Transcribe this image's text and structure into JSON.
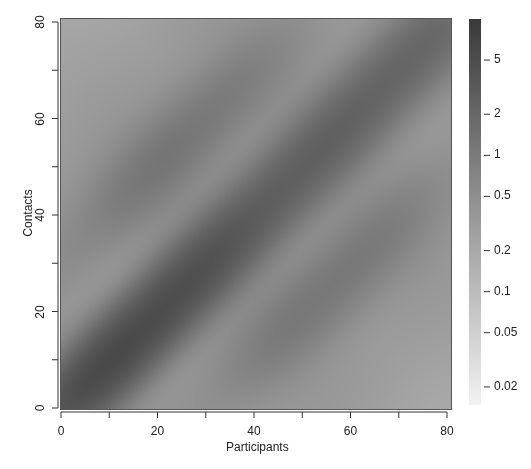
{
  "chart_data": {
    "type": "heatmap",
    "title": "",
    "xlabel": "Participants",
    "ylabel": "Contacts",
    "xlim": [
      0,
      80
    ],
    "ylim": [
      0,
      80
    ],
    "x_ticks": [
      0,
      20,
      40,
      60,
      80
    ],
    "x_minor_ticks": [
      10,
      30,
      50,
      70
    ],
    "y_ticks": [
      0,
      20,
      40,
      60,
      80
    ],
    "y_minor_ticks": [
      10,
      30,
      50,
      70
    ],
    "colorbar": {
      "scale": "log",
      "ticks": [
        5,
        2,
        1,
        0.5,
        0.2,
        0.1,
        0.05,
        0.02
      ],
      "tick_labels": [
        "5",
        "2",
        "1",
        "0.5",
        "0.2",
        "0.1",
        "0.05",
        "0.02"
      ],
      "range": [
        0.015,
        10
      ],
      "color_low": "#f2f2f2",
      "color_high": "#3a3a3a"
    },
    "features": [
      {
        "type": "diagonal",
        "offset": 0,
        "peak_age": 12,
        "intensity": 5.0,
        "width": 6
      },
      {
        "type": "diagonal",
        "offset": 0,
        "peak_age": 40,
        "intensity": 1.8,
        "width": 7
      },
      {
        "type": "diagonal",
        "offset": 0,
        "peak_age": 70,
        "intensity": 1.6,
        "width": 7
      },
      {
        "type": "offdiagonal",
        "offset": 30,
        "peak_age": 40,
        "intensity": 0.9,
        "width": 7
      },
      {
        "type": "offdiagonal",
        "offset": -30,
        "peak_age": 40,
        "intensity": 0.9,
        "width": 7
      }
    ],
    "background_level": 0.35,
    "grid": false
  }
}
